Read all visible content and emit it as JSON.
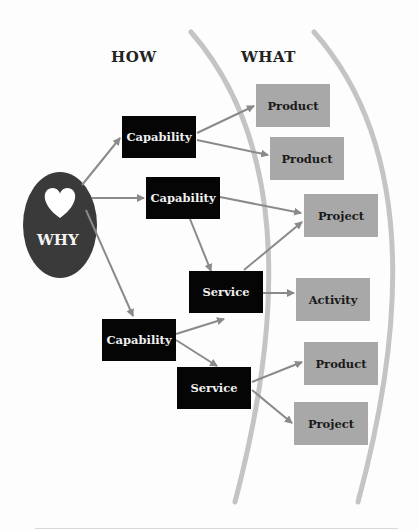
{
  "headers": {
    "how": "HOW",
    "what": "WHAT"
  },
  "why": {
    "label": "WHY",
    "icon": "heart-icon"
  },
  "colors": {
    "dark_box": "#050505",
    "light_box": "#a8a8a8",
    "arrow": "#8a8a8a",
    "arc": "#c4c4c4",
    "oval": "#3a3a3a"
  },
  "how_nodes": [
    {
      "id": "cap1",
      "label": "Capability"
    },
    {
      "id": "cap2",
      "label": "Capability"
    },
    {
      "id": "svc1",
      "label": "Service"
    },
    {
      "id": "cap3",
      "label": "Capability"
    },
    {
      "id": "svc2",
      "label": "Service"
    }
  ],
  "what_nodes": [
    {
      "id": "prod1",
      "label": "Product"
    },
    {
      "id": "prod2",
      "label": "Product"
    },
    {
      "id": "proj1",
      "label": "Project"
    },
    {
      "id": "act1",
      "label": "Activity"
    },
    {
      "id": "prod3",
      "label": "Product"
    },
    {
      "id": "proj2",
      "label": "Project"
    }
  ],
  "edges": [
    [
      "why",
      "cap1"
    ],
    [
      "why",
      "cap2"
    ],
    [
      "why",
      "cap3"
    ],
    [
      "cap1",
      "prod1"
    ],
    [
      "cap1",
      "prod2"
    ],
    [
      "cap2",
      "proj1"
    ],
    [
      "cap2",
      "svc1"
    ],
    [
      "svc1",
      "proj1"
    ],
    [
      "svc1",
      "act1"
    ],
    [
      "cap3",
      "svc1"
    ],
    [
      "cap3",
      "svc2"
    ],
    [
      "svc2",
      "prod3"
    ],
    [
      "svc2",
      "proj2"
    ]
  ]
}
